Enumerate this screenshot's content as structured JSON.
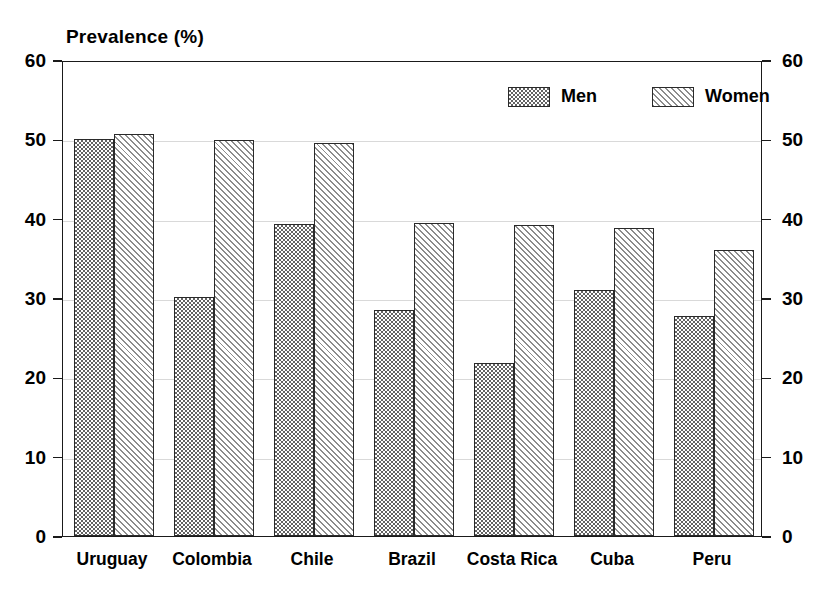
{
  "chart_data": {
    "type": "bar",
    "title": "Prevalence (%)",
    "xlabel": "",
    "ylabel": "Prevalence (%)",
    "ylim": [
      0,
      60
    ],
    "yticks": [
      0,
      10,
      20,
      30,
      40,
      50,
      60
    ],
    "ytick_labels": [
      "0",
      "10",
      "20",
      "30",
      "40",
      "50",
      "60"
    ],
    "right_axis": true,
    "right_ytick_labels": [
      "0",
      "10",
      "20",
      "30",
      "40",
      "50",
      "60"
    ],
    "grid": true,
    "legend_position": "top-right-inside",
    "categories": [
      "Uruguay",
      "Colombia",
      "Chile",
      "Brazil",
      "Costa Rica",
      "Cuba",
      "Peru"
    ],
    "series": [
      {
        "name": "Men",
        "pattern": "stipple",
        "color": "#636363",
        "values": [
          50.0,
          30.1,
          39.3,
          28.5,
          21.8,
          31.0,
          27.7
        ]
      },
      {
        "name": "Women",
        "pattern": "diagonal-hatch",
        "color": "#8c8c8c",
        "values": [
          50.7,
          49.9,
          49.5,
          39.4,
          39.2,
          38.8,
          36.0
        ]
      }
    ]
  },
  "legend": {
    "items": [
      {
        "label": "Men"
      },
      {
        "label": "Women"
      }
    ]
  },
  "colors": {
    "axis": "#1a1a1a",
    "grid": "#d9d9d9",
    "background": "#ffffff",
    "men_fill": "#636363",
    "women_fill": "#8c8c8c"
  }
}
